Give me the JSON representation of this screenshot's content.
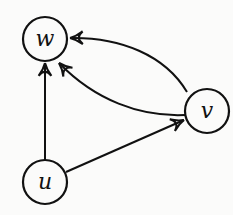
{
  "diagram": {
    "type": "directed-graph",
    "nodes": [
      {
        "id": "w",
        "label": "w",
        "cx": 45,
        "cy": 39,
        "r": 22
      },
      {
        "id": "v",
        "label": "v",
        "cx": 207,
        "cy": 111,
        "r": 22
      },
      {
        "id": "u",
        "label": "u",
        "cx": 45,
        "cy": 182,
        "r": 22
      }
    ],
    "edges": [
      {
        "from": "u",
        "to": "w",
        "style": "straight"
      },
      {
        "from": "u",
        "to": "v",
        "style": "straight"
      },
      {
        "from": "v",
        "to": "w",
        "style": "curve-upper"
      },
      {
        "from": "v",
        "to": "w",
        "style": "curve-lower"
      }
    ],
    "colors": {
      "stroke": "#111111",
      "background": "#fbfbfa"
    }
  }
}
